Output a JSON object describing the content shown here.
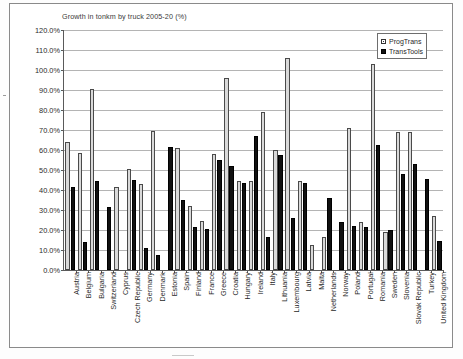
{
  "chart_data": {
    "type": "bar",
    "title": "Growth in tonkm by truck 2005-20 (%)",
    "xlabel": "",
    "ylabel": "",
    "ylim": [
      0,
      120
    ],
    "ytick_step": 10,
    "ytick_labels": [
      "0.0%",
      "10.0%",
      "20.0%",
      "30.0%",
      "40.0%",
      "50.0%",
      "60.0%",
      "70.0%",
      "80.0%",
      "90.0%",
      "100.0%",
      "110.0%",
      "120.0%"
    ],
    "grid": true,
    "legend_position": "top-right",
    "categories": [
      "Austria",
      "Belgium",
      "Bulgaria",
      "Switzerland",
      "Cyprus",
      "Czech Republic",
      "Germany",
      "Denmark",
      "Estonia",
      "Spain",
      "Finland",
      "France",
      "Greece",
      "Croatia",
      "Hungary",
      "Ireland",
      "Italy",
      "Lithuania",
      "Luxembourg",
      "Latvia",
      "Malta",
      "Netherlands",
      "Norway",
      "Poland",
      "Portugal",
      "Romania",
      "Sweden",
      "Slovenia",
      "Slovak Republic",
      "Turkey",
      "United Kingdom"
    ],
    "series": [
      {
        "name": "ProgTrans",
        "color": "#d9d9d9",
        "values": [
          64.0,
          58.5,
          90.5,
          0.0,
          41.5,
          50.5,
          43.0,
          69.5,
          0.0,
          61.0,
          32.0,
          24.5,
          58.0,
          96.0,
          44.5,
          44.5,
          79.0,
          60.0,
          106.0,
          44.5,
          12.5,
          16.5,
          0.0,
          71.0,
          24.0,
          103.0,
          19.0,
          69.0,
          69.0,
          0.0,
          27.0
        ]
      },
      {
        "name": "TransTools",
        "color": "#111111",
        "values": [
          41.5,
          14.0,
          44.5,
          31.5,
          0.0,
          45.0,
          11.0,
          7.5,
          61.5,
          35.0,
          21.5,
          20.5,
          55.0,
          52.0,
          43.5,
          67.0,
          16.5,
          57.5,
          26.0,
          43.5,
          0.0,
          36.0,
          24.0,
          22.0,
          21.5,
          62.5,
          20.0,
          48.0,
          53.0,
          45.5,
          14.5
        ]
      }
    ]
  },
  "legend": {
    "items": [
      {
        "label": "ProgTrans",
        "marker": "open-square-marker"
      },
      {
        "label": "TransTools",
        "marker": "filled-square-marker"
      }
    ]
  }
}
